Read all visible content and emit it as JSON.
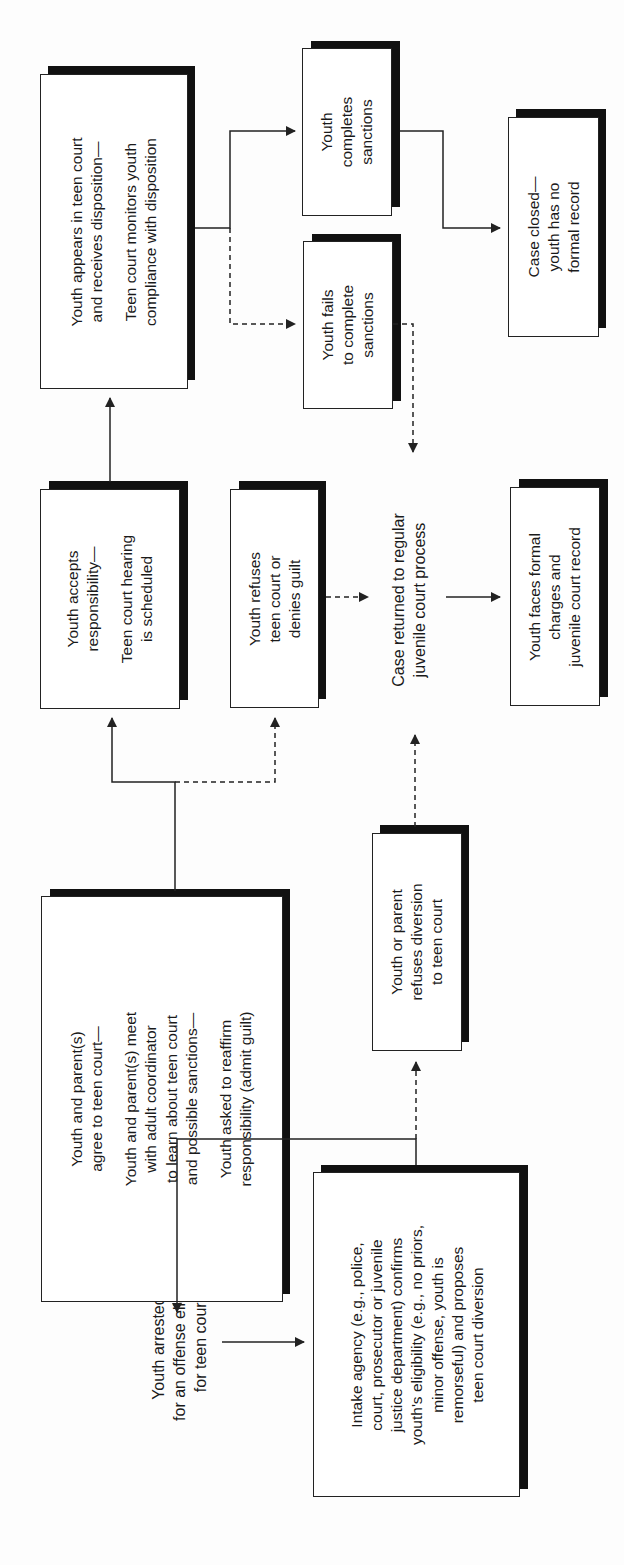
{
  "diagram": {
    "orientation": "rotated-90-ccw",
    "nodes": {
      "arrested": {
        "lines": [
          "Youth arrested*",
          "for an offense eligible",
          "for teen court"
        ]
      },
      "intake": {
        "lines": [
          "Intake agency (e.g., police,",
          "court, prosecutor or juvenile",
          "justice department) confirms",
          "youth's eligibility (e.g., no priors,",
          "minor offense, youth is",
          "remorseful) and proposes",
          "teen court diversion"
        ]
      },
      "agree": {
        "para1": [
          "Youth and parent(s)",
          "agree to teen court—"
        ],
        "para2": [
          "Youth and parent(s) meet",
          "with adult coordinator",
          "to learn about teen court",
          "and possible sanctions—"
        ],
        "para3": [
          "Youth asked to reaffirm",
          "responsibility (admit guilt)"
        ]
      },
      "refuses_diversion": {
        "lines": [
          "Youth or parent",
          "refuses diversion",
          "to teen court"
        ]
      },
      "accepts": {
        "para1": [
          "Youth accepts",
          "responsibility—"
        ],
        "para2": [
          "Teen court hearing",
          "is scheduled"
        ]
      },
      "refuses_teen_court": {
        "lines": [
          "Youth refuses",
          "teen court or",
          "denies guilt"
        ]
      },
      "case_returned": {
        "lines": [
          "Case returned to regular",
          "juvenile court process"
        ]
      },
      "faces_charges": {
        "lines": [
          "Youth faces formal",
          "charges and",
          "juvenile court record"
        ]
      },
      "appears": {
        "para1": [
          "Youth appears in teen court",
          "and receives disposition—"
        ],
        "para2": [
          "Teen court monitors youth",
          "compliance with disposition"
        ]
      },
      "fails": {
        "lines": [
          "Youth fails",
          "to complete",
          "sanctions"
        ]
      },
      "completes": {
        "lines": [
          "Youth",
          "completes",
          "sanctions"
        ]
      },
      "case_closed": {
        "lines": [
          "Case closed—",
          "youth has no",
          "formal record"
        ]
      }
    },
    "edges": [
      {
        "from": "arrested",
        "to": "intake",
        "style": "solid"
      },
      {
        "from": "intake",
        "to": "agree",
        "style": "solid"
      },
      {
        "from": "intake",
        "to": "refuses_diversion",
        "style": "dashed"
      },
      {
        "from": "refuses_diversion",
        "to": "case_returned",
        "style": "dashed"
      },
      {
        "from": "agree",
        "to": "accepts",
        "style": "solid"
      },
      {
        "from": "agree",
        "to": "refuses_teen_court",
        "style": "dashed"
      },
      {
        "from": "refuses_teen_court",
        "to": "case_returned",
        "style": "dashed"
      },
      {
        "from": "accepts",
        "to": "appears",
        "style": "solid"
      },
      {
        "from": "appears",
        "to": "completes",
        "style": "solid"
      },
      {
        "from": "appears",
        "to": "fails",
        "style": "dashed"
      },
      {
        "from": "fails",
        "to": "case_returned",
        "style": "dashed"
      },
      {
        "from": "completes",
        "to": "case_closed",
        "style": "solid"
      },
      {
        "from": "case_returned",
        "to": "faces_charges",
        "style": "solid"
      }
    ],
    "colors": {
      "line": "#222222",
      "shadow": "#111111",
      "box_fill": "#ffffff",
      "background": "#fdfdfd"
    }
  }
}
